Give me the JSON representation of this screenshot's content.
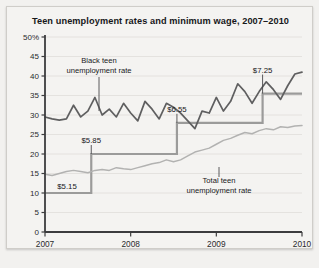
{
  "figure": {
    "title": "Teen unemployment rates and minimum wage, 2007–2010",
    "background": "#f2f1ef",
    "panel_background": "#f4f3f1",
    "border_color": "#cfcdc9"
  },
  "annotations": {
    "black_teen_label_line1": "Black teen",
    "black_teen_label_line2": "unemployment rate",
    "total_teen_label_line1": "Total teen",
    "total_teen_label_line2": "unemployment rate",
    "wage_5_15": "$5.15",
    "wage_5_85": "$5.85",
    "wage_6_55": "$6.55",
    "wage_7_25": "$7.25"
  },
  "axis": {
    "y_ticks": [
      "50%",
      "45",
      "40",
      "35",
      "30",
      "25",
      "20",
      "15",
      "10",
      "5",
      "0"
    ],
    "x_ticks": [
      "2007",
      "2008",
      "2009",
      "2010"
    ]
  },
  "chart_data": {
    "type": "line",
    "title": "Teen unemployment rates and minimum wage, 2007–2010",
    "xlabel": "",
    "ylabel": "",
    "ylim": [
      0,
      50
    ],
    "xlim": [
      2007.0,
      2010.0
    ],
    "grid": true,
    "legend": "annotated-inline",
    "y_tick_values": [
      0,
      5,
      10,
      15,
      20,
      25,
      30,
      35,
      40,
      45,
      50
    ],
    "x_tick_values": [
      2007,
      2008,
      2009,
      2010
    ],
    "colors": {
      "black_teen": "#5f5f60",
      "total_teen": "#b2b2b1",
      "minimum_wage": "#9b9b9a",
      "axis": "#3c3c3e",
      "gridline": "#e2e0dc"
    },
    "series": [
      {
        "name": "Black teen unemployment rate",
        "color": "#5f5f60",
        "x": [
          2007.0,
          2007.083,
          2007.167,
          2007.25,
          2007.333,
          2007.417,
          2007.5,
          2007.583,
          2007.667,
          2007.75,
          2007.833,
          2007.917,
          2008.0,
          2008.083,
          2008.167,
          2008.25,
          2008.333,
          2008.417,
          2008.5,
          2008.583,
          2008.667,
          2008.75,
          2008.833,
          2008.917,
          2009.0,
          2009.083,
          2009.167,
          2009.25,
          2009.333,
          2009.417,
          2009.5,
          2009.583,
          2009.667,
          2009.75,
          2009.833,
          2009.917,
          2010.0
        ],
        "values": [
          29.5,
          29.0,
          28.7,
          29.0,
          32.5,
          29.5,
          31.0,
          34.5,
          30.0,
          31.5,
          29.5,
          33.0,
          30.5,
          28.5,
          33.5,
          31.5,
          29.0,
          33.0,
          32.0,
          30.5,
          28.5,
          26.5,
          31.0,
          30.5,
          34.5,
          31.0,
          33.5,
          38.0,
          36.0,
          33.0,
          36.0,
          38.5,
          36.5,
          34.0,
          37.5,
          40.5,
          41.0
        ],
        "units": "percent"
      },
      {
        "name": "Total teen unemployment rate",
        "color": "#b2b2b1",
        "x": [
          2007.0,
          2007.083,
          2007.167,
          2007.25,
          2007.333,
          2007.417,
          2007.5,
          2007.583,
          2007.667,
          2007.75,
          2007.833,
          2007.917,
          2008.0,
          2008.083,
          2008.167,
          2008.25,
          2008.333,
          2008.417,
          2008.5,
          2008.583,
          2008.667,
          2008.75,
          2008.833,
          2008.917,
          2009.0,
          2009.083,
          2009.167,
          2009.25,
          2009.333,
          2009.417,
          2009.5,
          2009.583,
          2009.667,
          2009.75,
          2009.833,
          2009.917,
          2010.0
        ],
        "values": [
          14.8,
          14.5,
          15.0,
          15.5,
          15.8,
          15.5,
          15.2,
          15.8,
          16.0,
          15.8,
          16.5,
          16.2,
          16.0,
          16.5,
          17.0,
          17.5,
          17.8,
          18.5,
          18.0,
          18.5,
          19.5,
          20.5,
          21.0,
          21.5,
          22.5,
          23.5,
          24.0,
          24.8,
          25.5,
          25.2,
          26.0,
          26.5,
          26.2,
          27.0,
          26.8,
          27.2,
          27.3
        ],
        "units": "percent"
      }
    ],
    "minimum_wage_steps": [
      {
        "label": "$5.15",
        "value": 5.15,
        "plot_level": 10.0,
        "x_start": 2007.0,
        "x_end": 2007.54
      },
      {
        "label": "$5.85",
        "value": 5.85,
        "plot_level": 20.0,
        "x_start": 2007.54,
        "x_end": 2008.54
      },
      {
        "label": "$6.55",
        "value": 6.55,
        "plot_level": 28.0,
        "x_start": 2008.54,
        "x_end": 2009.54
      },
      {
        "label": "$7.25",
        "value": 7.25,
        "plot_level": 35.5,
        "x_start": 2009.54,
        "x_end": 2010.0
      }
    ]
  }
}
